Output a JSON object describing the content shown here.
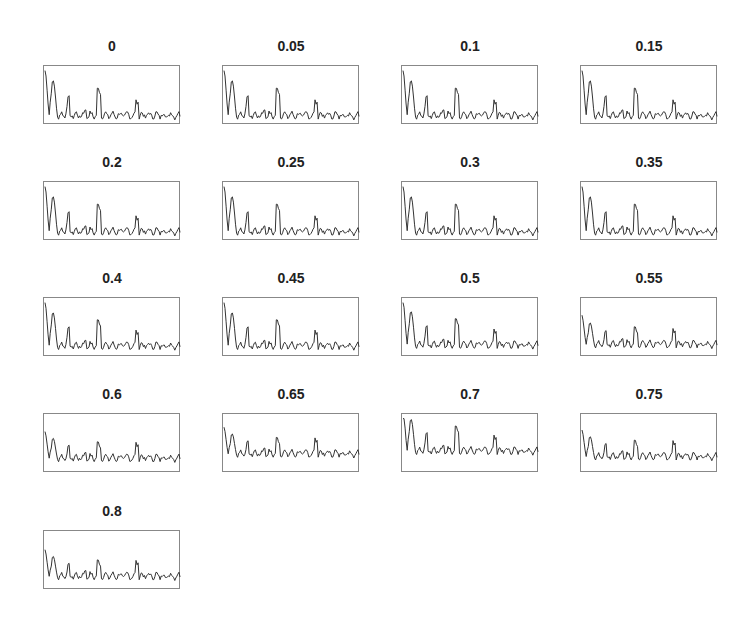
{
  "chart_data": {
    "type": "line",
    "layout": "small-multiples grid, 4 columns x 5 rows",
    "grid": false,
    "axes_ticks": false,
    "legend": null,
    "titles": [
      "0",
      "0.05",
      "0.1",
      "0.15",
      "0.2",
      "0.25",
      "0.3",
      "0.35",
      "0.4",
      "0.45",
      "0.5",
      "0.55",
      "0.6",
      "0.65",
      "0.7",
      "0.75",
      "0.8"
    ],
    "series_profile": {
      "left_peak_height": [
        0.95,
        0.95,
        0.95,
        0.95,
        0.95,
        0.95,
        0.95,
        0.95,
        0.9,
        0.9,
        0.9,
        0.55,
        0.5,
        0.5,
        0.85,
        0.5,
        0.5
      ],
      "baseline": [
        0.12,
        0.12,
        0.12,
        0.12,
        0.12,
        0.12,
        0.12,
        0.12,
        0.15,
        0.15,
        0.17,
        0.18,
        0.22,
        0.3,
        0.35,
        0.25,
        0.2
      ]
    },
    "colors": {
      "line": "#333333",
      "frame": "#888888"
    }
  },
  "panels": [
    {
      "title": "0"
    },
    {
      "title": "0.05"
    },
    {
      "title": "0.1"
    },
    {
      "title": "0.15"
    },
    {
      "title": "0.2"
    },
    {
      "title": "0.25"
    },
    {
      "title": "0.3"
    },
    {
      "title": "0.35"
    },
    {
      "title": "0.4"
    },
    {
      "title": "0.45"
    },
    {
      "title": "0.5"
    },
    {
      "title": "0.55"
    },
    {
      "title": "0.6"
    },
    {
      "title": "0.65"
    },
    {
      "title": "0.7"
    },
    {
      "title": "0.75"
    },
    {
      "title": "0.8"
    }
  ]
}
